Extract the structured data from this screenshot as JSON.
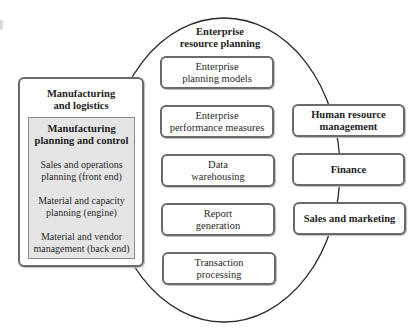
{
  "diagram": {
    "ellipse_title": "Enterprise resource planning",
    "ellipse_title_lines": [
      "Enterprise",
      "resource planning"
    ],
    "left_module": {
      "title": "Manufacturing and logistics",
      "title_lines": [
        "Manufacturing",
        "and logistics"
      ],
      "inner": {
        "title_lines": [
          "Manufacturing",
          "planning and control"
        ],
        "items": [
          {
            "lines": [
              "Sales and operations",
              "planning (front end)"
            ]
          },
          {
            "lines": [
              "Material and capacity",
              "planning (engine)"
            ]
          },
          {
            "lines": [
              "Material and vendor",
              "management (back end)"
            ]
          }
        ]
      }
    },
    "center_modules": [
      {
        "lines": [
          "Enterprise",
          "planning models"
        ]
      },
      {
        "lines": [
          "Enterprise",
          "performance measures"
        ]
      },
      {
        "lines": [
          "Data",
          "warehousing"
        ]
      },
      {
        "lines": [
          "Report",
          "generation"
        ]
      },
      {
        "lines": [
          "Transaction",
          "processing"
        ]
      }
    ],
    "right_modules": [
      {
        "lines": [
          "Human resource",
          "management"
        ]
      },
      {
        "lines": [
          "Finance"
        ]
      },
      {
        "lines": [
          "Sales and marketing"
        ]
      }
    ],
    "colors": {
      "border": "#6a6a6a",
      "inner_fill": "#e4e4e4",
      "ellipse_stroke": "#2a2a2a"
    }
  }
}
